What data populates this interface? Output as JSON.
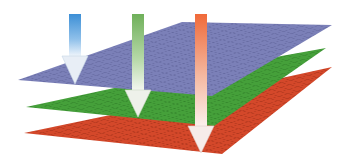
{
  "diagram": {
    "type": "stacked-layers-with-arrows",
    "layers": [
      {
        "name": "top-layer",
        "color": "#7b80b8",
        "grid": "#5e6399"
      },
      {
        "name": "middle-layer",
        "color": "#45a03a",
        "grid": "#2f7d28"
      },
      {
        "name": "bottom-layer",
        "color": "#d4482a",
        "grid": "#9e2f18"
      }
    ],
    "arrows": [
      {
        "name": "blue-arrow",
        "color": "#3c8fd6",
        "ends_at": "top-layer"
      },
      {
        "name": "green-arrow",
        "color": "#6fb05a",
        "ends_at": "middle-layer"
      },
      {
        "name": "orange-arrow",
        "color": "#f06a3a",
        "ends_at": "bottom-layer"
      }
    ]
  }
}
